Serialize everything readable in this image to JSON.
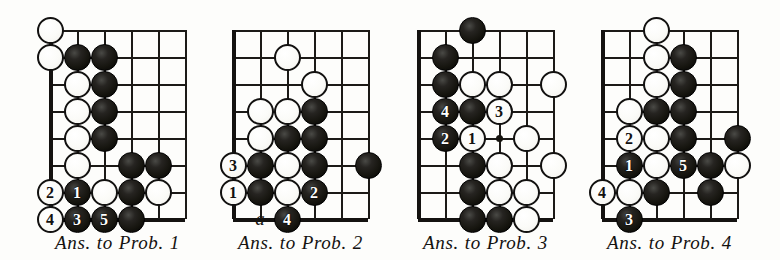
{
  "page": {
    "kind": "go-problem-answer-diagrams",
    "background_color": "#fdfdfb",
    "ink_color": "#141210",
    "stone_black_color": "#16150f",
    "stone_white_color": "#fbfbf8",
    "diagram_count": 4
  },
  "diagrams": [
    {
      "id": "diagram-1",
      "caption": "Ans. to Prob. 1",
      "caption_words": [
        "Ans.",
        "to",
        "Prob.",
        "1"
      ],
      "origin_x": 50,
      "origin_y": 30,
      "cell": 27,
      "cols": 6,
      "rows": 8,
      "edges": [
        "left",
        "bottom"
      ],
      "star_points": [],
      "board_labels": [],
      "stones": [
        {
          "color": "white",
          "col": 0,
          "row": 0,
          "label": ""
        },
        {
          "color": "white",
          "col": 0,
          "row": 1,
          "label": ""
        },
        {
          "color": "black",
          "col": 1,
          "row": 1,
          "label": ""
        },
        {
          "color": "black",
          "col": 2,
          "row": 1,
          "label": ""
        },
        {
          "color": "white",
          "col": 1,
          "row": 2,
          "label": ""
        },
        {
          "color": "black",
          "col": 2,
          "row": 2,
          "label": ""
        },
        {
          "color": "white",
          "col": 1,
          "row": 3,
          "label": ""
        },
        {
          "color": "black",
          "col": 2,
          "row": 3,
          "label": ""
        },
        {
          "color": "white",
          "col": 1,
          "row": 4,
          "label": ""
        },
        {
          "color": "black",
          "col": 2,
          "row": 4,
          "label": ""
        },
        {
          "color": "white",
          "col": 1,
          "row": 5,
          "label": ""
        },
        {
          "color": "black",
          "col": 3,
          "row": 5,
          "label": ""
        },
        {
          "color": "black",
          "col": 4,
          "row": 5,
          "label": ""
        },
        {
          "color": "white",
          "col": 0,
          "row": 6,
          "label": "2"
        },
        {
          "color": "black",
          "col": 1,
          "row": 6,
          "label": "1"
        },
        {
          "color": "white",
          "col": 2,
          "row": 6,
          "label": ""
        },
        {
          "color": "black",
          "col": 3,
          "row": 6,
          "label": ""
        },
        {
          "color": "white",
          "col": 4,
          "row": 6,
          "label": ""
        },
        {
          "color": "white",
          "col": 0,
          "row": 7,
          "label": "4"
        },
        {
          "color": "black",
          "col": 1,
          "row": 7,
          "label": "3"
        },
        {
          "color": "black",
          "col": 2,
          "row": 7,
          "label": "5"
        },
        {
          "color": "black",
          "col": 3,
          "row": 7,
          "label": ""
        }
      ]
    },
    {
      "id": "diagram-2",
      "caption": "Ans. to Prob. 2",
      "caption_words": [
        "Ans.",
        "to",
        "Prob.",
        "2"
      ],
      "origin_x": 233,
      "origin_y": 30,
      "cell": 27,
      "cols": 6,
      "rows": 8,
      "edges": [
        "left",
        "bottom"
      ],
      "star_points": [],
      "board_labels": [
        {
          "text": "a",
          "col": 1,
          "row": 7
        }
      ],
      "stones": [
        {
          "color": "white",
          "col": 2,
          "row": 1,
          "label": ""
        },
        {
          "color": "white",
          "col": 3,
          "row": 2,
          "label": ""
        },
        {
          "color": "white",
          "col": 1,
          "row": 3,
          "label": ""
        },
        {
          "color": "white",
          "col": 2,
          "row": 3,
          "label": ""
        },
        {
          "color": "black",
          "col": 3,
          "row": 3,
          "label": ""
        },
        {
          "color": "white",
          "col": 1,
          "row": 4,
          "label": ""
        },
        {
          "color": "black",
          "col": 2,
          "row": 4,
          "label": ""
        },
        {
          "color": "black",
          "col": 3,
          "row": 4,
          "label": ""
        },
        {
          "color": "white",
          "col": 0,
          "row": 5,
          "label": "3"
        },
        {
          "color": "black",
          "col": 1,
          "row": 5,
          "label": ""
        },
        {
          "color": "white",
          "col": 2,
          "row": 5,
          "label": ""
        },
        {
          "color": "black",
          "col": 3,
          "row": 5,
          "label": ""
        },
        {
          "color": "black",
          "col": 5,
          "row": 5,
          "label": ""
        },
        {
          "color": "white",
          "col": 0,
          "row": 6,
          "label": "1"
        },
        {
          "color": "black",
          "col": 1,
          "row": 6,
          "label": ""
        },
        {
          "color": "white",
          "col": 2,
          "row": 6,
          "label": ""
        },
        {
          "color": "black",
          "col": 3,
          "row": 6,
          "label": "2"
        },
        {
          "color": "black",
          "col": 2,
          "row": 7,
          "label": "4"
        }
      ]
    },
    {
      "id": "diagram-3",
      "caption": "Ans. to Prob. 3",
      "caption_words": [
        "Ans.",
        "to",
        "Prob.",
        "3"
      ],
      "origin_x": 418,
      "origin_y": 30,
      "cell": 27,
      "cols": 6,
      "rows": 8,
      "edges": [
        "left",
        "bottom"
      ],
      "star_points": [
        {
          "col": 3,
          "row": 4
        }
      ],
      "board_labels": [],
      "stones": [
        {
          "color": "black",
          "col": 2,
          "row": 0,
          "label": ""
        },
        {
          "color": "black",
          "col": 1,
          "row": 1,
          "label": ""
        },
        {
          "color": "black",
          "col": 1,
          "row": 2,
          "label": ""
        },
        {
          "color": "white",
          "col": 2,
          "row": 2,
          "label": ""
        },
        {
          "color": "white",
          "col": 3,
          "row": 2,
          "label": ""
        },
        {
          "color": "white",
          "col": 5,
          "row": 2,
          "label": ""
        },
        {
          "color": "black",
          "col": 1,
          "row": 3,
          "label": "4"
        },
        {
          "color": "black",
          "col": 2,
          "row": 3,
          "label": ""
        },
        {
          "color": "white",
          "col": 3,
          "row": 3,
          "label": "3"
        },
        {
          "color": "black",
          "col": 1,
          "row": 4,
          "label": "2"
        },
        {
          "color": "white",
          "col": 2,
          "row": 4,
          "label": "1"
        },
        {
          "color": "white",
          "col": 4,
          "row": 4,
          "label": ""
        },
        {
          "color": "black",
          "col": 2,
          "row": 5,
          "label": ""
        },
        {
          "color": "white",
          "col": 3,
          "row": 5,
          "label": ""
        },
        {
          "color": "white",
          "col": 5,
          "row": 5,
          "label": ""
        },
        {
          "color": "black",
          "col": 2,
          "row": 6,
          "label": ""
        },
        {
          "color": "white",
          "col": 3,
          "row": 6,
          "label": ""
        },
        {
          "color": "white",
          "col": 4,
          "row": 6,
          "label": ""
        },
        {
          "color": "black",
          "col": 2,
          "row": 7,
          "label": ""
        },
        {
          "color": "black",
          "col": 3,
          "row": 7,
          "label": ""
        },
        {
          "color": "white",
          "col": 4,
          "row": 7,
          "label": ""
        }
      ]
    },
    {
      "id": "diagram-4",
      "caption": "Ans. to Prob. 4",
      "caption_words": [
        "Ans.",
        "to",
        "Prob.",
        "4"
      ],
      "origin_x": 602,
      "origin_y": 30,
      "cell": 27,
      "cols": 6,
      "rows": 8,
      "edges": [
        "left",
        "bottom"
      ],
      "star_points": [],
      "board_labels": [],
      "stones": [
        {
          "color": "white",
          "col": 2,
          "row": 0,
          "label": ""
        },
        {
          "color": "white",
          "col": 2,
          "row": 1,
          "label": ""
        },
        {
          "color": "black",
          "col": 3,
          "row": 1,
          "label": ""
        },
        {
          "color": "white",
          "col": 2,
          "row": 2,
          "label": ""
        },
        {
          "color": "black",
          "col": 3,
          "row": 2,
          "label": ""
        },
        {
          "color": "white",
          "col": 1,
          "row": 3,
          "label": ""
        },
        {
          "color": "black",
          "col": 2,
          "row": 3,
          "label": ""
        },
        {
          "color": "black",
          "col": 3,
          "row": 3,
          "label": ""
        },
        {
          "color": "white",
          "col": 1,
          "row": 4,
          "label": "2"
        },
        {
          "color": "white",
          "col": 2,
          "row": 4,
          "label": ""
        },
        {
          "color": "black",
          "col": 3,
          "row": 4,
          "label": ""
        },
        {
          "color": "black",
          "col": 5,
          "row": 4,
          "label": ""
        },
        {
          "color": "black",
          "col": 1,
          "row": 5,
          "label": "1"
        },
        {
          "color": "white",
          "col": 2,
          "row": 5,
          "label": ""
        },
        {
          "color": "black",
          "col": 3,
          "row": 5,
          "label": "5"
        },
        {
          "color": "black",
          "col": 4,
          "row": 5,
          "label": ""
        },
        {
          "color": "white",
          "col": 5,
          "row": 5,
          "label": ""
        },
        {
          "color": "white",
          "col": 0,
          "row": 6,
          "label": "4"
        },
        {
          "color": "white",
          "col": 1,
          "row": 6,
          "label": ""
        },
        {
          "color": "black",
          "col": 2,
          "row": 6,
          "label": ""
        },
        {
          "color": "black",
          "col": 4,
          "row": 6,
          "label": ""
        },
        {
          "color": "black",
          "col": 1,
          "row": 7,
          "label": "3"
        }
      ]
    }
  ]
}
